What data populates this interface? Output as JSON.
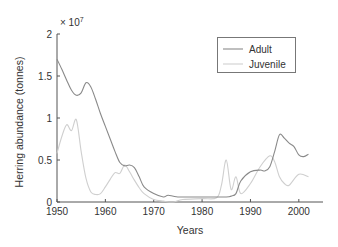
{
  "chart_data": {
    "type": "line",
    "title": "",
    "xlabel": "Years",
    "ylabel": "Herring abundance (tonnes)",
    "y_multiplier": "× 10",
    "y_multiplier_exp": "7",
    "xlim": [
      1950,
      2005
    ],
    "ylim": [
      0,
      2
    ],
    "xticks": [
      "1950",
      "1960",
      "1970",
      "1980",
      "1990",
      "2000"
    ],
    "yticks": [
      "0",
      "0.5",
      "1",
      "1.5",
      "2"
    ],
    "legend_position": "upper right",
    "series": [
      {
        "name": "Adult",
        "color": "#8a8a8a",
        "x": [
          1950,
          1951,
          1952,
          1953,
          1954,
          1955,
          1956,
          1957,
          1958,
          1959,
          1960,
          1961,
          1962,
          1963,
          1964,
          1965,
          1966,
          1967,
          1968,
          1970,
          1972,
          1973,
          1975,
          1980,
          1985,
          1986,
          1987,
          1988,
          1990,
          1992,
          1993,
          1994,
          1995,
          1996,
          1997,
          1998,
          1999,
          2000,
          2001,
          2002
        ],
        "values": [
          1.7,
          1.58,
          1.45,
          1.33,
          1.27,
          1.3,
          1.42,
          1.37,
          1.22,
          1.05,
          0.9,
          0.75,
          0.6,
          0.47,
          0.43,
          0.44,
          0.41,
          0.3,
          0.18,
          0.1,
          0.06,
          0.08,
          0.06,
          0.06,
          0.06,
          0.07,
          0.1,
          0.25,
          0.36,
          0.38,
          0.37,
          0.42,
          0.6,
          0.8,
          0.76,
          0.7,
          0.66,
          0.56,
          0.54,
          0.57
        ]
      },
      {
        "name": "Juvenile",
        "color": "#cfcfcf",
        "x": [
          1950,
          1951,
          1952,
          1953,
          1954,
          1955,
          1956,
          1957,
          1958,
          1959,
          1960,
          1961,
          1962,
          1963,
          1964,
          1965,
          1966,
          1967,
          1968,
          1970,
          1972,
          1974,
          1976,
          1980,
          1983,
          1984,
          1985,
          1986,
          1987,
          1988,
          1990,
          1992,
          1994,
          1995,
          1996,
          1997,
          1998,
          2000,
          2002
        ],
        "values": [
          0.58,
          0.78,
          0.92,
          0.85,
          0.98,
          0.6,
          0.28,
          0.12,
          0.09,
          0.1,
          0.18,
          0.27,
          0.35,
          0.34,
          0.44,
          0.36,
          0.26,
          0.17,
          0.1,
          0.03,
          0.01,
          0.0,
          0.03,
          0.04,
          0.05,
          0.2,
          0.5,
          0.15,
          0.3,
          0.1,
          0.22,
          0.42,
          0.55,
          0.48,
          0.3,
          0.22,
          0.2,
          0.33,
          0.3
        ]
      }
    ]
  }
}
